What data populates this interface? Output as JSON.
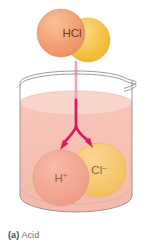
{
  "figure": {
    "caption_label": "(a)",
    "caption_text": "Acid",
    "molecule": {
      "name": "hydrogen-chloride-molecule",
      "label": "HCl"
    },
    "ions": [
      {
        "name": "hydrogen-ion",
        "label": "H",
        "charge": "+",
        "color": "#ef9481"
      },
      {
        "name": "chloride-ion",
        "label": "Cl",
        "charge": "–",
        "color": "#f2ca4e"
      }
    ],
    "beaker": {
      "name": "beaker",
      "outline_color": "#8c8c8c",
      "liquid_color": "#f4bdb0",
      "liquid_surface_color": "#f7cec3"
    },
    "arrow": {
      "name": "dissociation-arrow",
      "color": "#d81e63",
      "stem_color": "#f07ba4"
    },
    "colors": {
      "h_sphere": "#f3a08a",
      "h_sphere_dark": "#e78b72",
      "cl_sphere": "#f5cf5a",
      "cl_sphere_dark": "#eec02f",
      "hcl_h_sphere": "#f6a06f",
      "hcl_cl_sphere": "#f6c14e",
      "text_dark": "#4a3525",
      "caption_gray": "#6f6f6f"
    }
  }
}
